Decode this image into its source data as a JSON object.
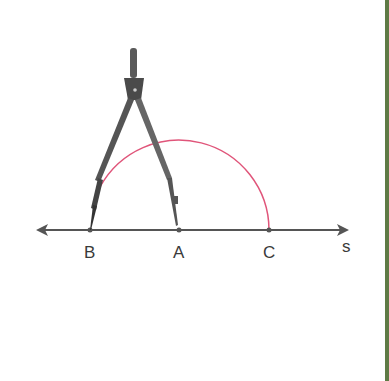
{
  "diagram": {
    "line_name": "s",
    "points": [
      {
        "label": "B",
        "x": 90
      },
      {
        "label": "A",
        "x": 179
      },
      {
        "label": "C",
        "x": 269
      }
    ],
    "arc": {
      "center": "A",
      "through": [
        "B",
        "C"
      ],
      "color": "#e0557a"
    },
    "tool": "compass",
    "colors": {
      "line": "#555555",
      "border": "#5e7a45"
    }
  }
}
